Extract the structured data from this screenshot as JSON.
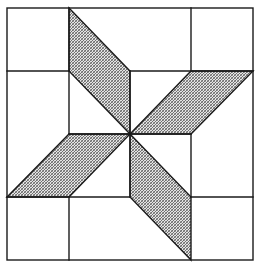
{
  "diagram": {
    "title": "",
    "type": "quilt-block-pinwheel-star",
    "colors": {
      "background": "#ffffff",
      "line": "#1a1a1a",
      "shade_light": "#e4e4e4",
      "shade_dark": "#6e6e6e"
    },
    "grid": {
      "x": [
        7,
        69,
        130,
        191,
        253
      ],
      "y": [
        8,
        71,
        134,
        197,
        260
      ]
    },
    "frame": {
      "x": 7,
      "y": 8,
      "width": 246,
      "height": 252
    },
    "segments": [
      {
        "name": "v-top-left-col",
        "x1": 69,
        "y1": 8,
        "x2": 69,
        "y2": 71
      },
      {
        "name": "h-top-left-row",
        "x1": 7,
        "y1": 71,
        "x2": 69,
        "y2": 71
      },
      {
        "name": "v-upper-left-center",
        "x1": 69,
        "y1": 71,
        "x2": 69,
        "y2": 134
      },
      {
        "name": "v-top-right-col",
        "x1": 191,
        "y1": 8,
        "x2": 191,
        "y2": 71
      },
      {
        "name": "h-upper-center-right",
        "x1": 130,
        "y1": 71,
        "x2": 253,
        "y2": 71
      },
      {
        "name": "v-upper-center",
        "x1": 130,
        "y1": 71,
        "x2": 130,
        "y2": 134
      },
      {
        "name": "v-lower-right-center",
        "x1": 191,
        "y1": 134,
        "x2": 191,
        "y2": 197
      },
      {
        "name": "h-lower-right-row",
        "x1": 191,
        "y1": 197,
        "x2": 253,
        "y2": 197
      },
      {
        "name": "h-lower-left-center",
        "x1": 7,
        "y1": 197,
        "x2": 130,
        "y2": 197
      },
      {
        "name": "v-lower-center",
        "x1": 130,
        "y1": 134,
        "x2": 130,
        "y2": 197
      },
      {
        "name": "v-bottom-left-col",
        "x1": 69,
        "y1": 197,
        "x2": 69,
        "y2": 260
      },
      {
        "name": "h-center-left",
        "x1": 69,
        "y1": 134,
        "x2": 130,
        "y2": 134
      },
      {
        "name": "h-center-right",
        "x1": 130,
        "y1": 134,
        "x2": 191,
        "y2": 134
      }
    ],
    "shaded_shapes": [
      {
        "name": "top-parallelogram",
        "points": "69,8 130,71 130,134 69,71"
      },
      {
        "name": "right-parallelogram",
        "points": "191,71 253,71 191,134 130,134"
      },
      {
        "name": "left-parallelogram",
        "points": "69,134 130,134 69,197 7,197"
      },
      {
        "name": "bottom-parallelogram",
        "points": "130,134 191,197 191,260 130,197"
      }
    ],
    "center": {
      "x": 130,
      "y": 134
    }
  }
}
